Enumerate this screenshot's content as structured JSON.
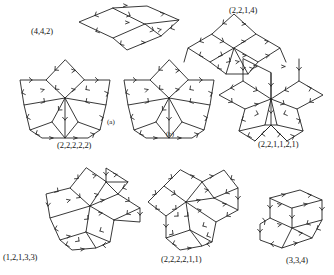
{
  "sheet": {
    "title": "Rhombic tiling diagrams with oriented edges",
    "background": "#ffffff",
    "stroke_color": "#222222",
    "width": 334,
    "height": 275
  },
  "figures": [
    {
      "id": "fig-442",
      "caption": "(4,4,2)",
      "sublabel": "",
      "shape": "parallelepiped-projection",
      "tiles": 3,
      "directions": 3,
      "partition": [
        4,
        4,
        2
      ]
    },
    {
      "id": "fig-2214",
      "caption": "(2,2,1,4)",
      "sublabel": "",
      "shape": "crown-rosette",
      "tiles": 5,
      "directions": 4,
      "partition": [
        2,
        2,
        1,
        4
      ]
    },
    {
      "id": "fig-22222-a",
      "caption": "(2,2,2,2,2)",
      "sublabel": "(a)",
      "shape": "five-point-star",
      "tiles": 10,
      "directions": 5,
      "partition": [
        2,
        2,
        2,
        2,
        2
      ]
    },
    {
      "id": "fig-22222-b",
      "caption": "",
      "sublabel": "(b)",
      "shape": "five-point-star",
      "tiles": 10,
      "directions": 5,
      "partition": [
        2,
        2,
        2,
        2,
        2
      ]
    },
    {
      "id": "fig-221121",
      "caption": "(2,2,1,1,2,1)",
      "sublabel": "",
      "shape": "six-point-rosette",
      "tiles": 12,
      "directions": 6,
      "partition": [
        2,
        2,
        1,
        1,
        2,
        1
      ]
    },
    {
      "id": "fig-12133",
      "caption": "(1,2,1,3,3)",
      "sublabel": "",
      "shape": "asymmetric-rosette",
      "tiles": 10,
      "directions": 5,
      "partition": [
        1,
        2,
        1,
        3,
        3
      ]
    },
    {
      "id": "fig-222211",
      "caption": "(2,2,2,2,1,1)",
      "sublabel": "",
      "shape": "six-point-rosette",
      "tiles": 12,
      "directions": 6,
      "partition": [
        2,
        2,
        2,
        2,
        1,
        1
      ]
    },
    {
      "id": "fig-334",
      "caption": "(3,3,4)",
      "sublabel": "",
      "shape": "parallelepiped-projection",
      "tiles": 3,
      "directions": 3,
      "partition": [
        3,
        3,
        4
      ]
    }
  ]
}
